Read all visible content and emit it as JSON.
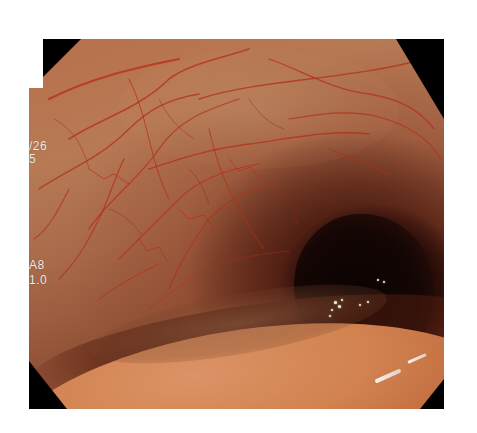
{
  "image": {
    "description": "Endoscopic (colonoscopy) view of colonic lumen with visible submucosal vascular pattern",
    "frame_shape": "octagonal endoscope frame with black corners"
  },
  "overlay": {
    "date_fragment": "/26",
    "line2": "5",
    "mode_label": "A8",
    "ratio_value": "1.0"
  },
  "colors": {
    "mucosa_light": "#dc9366",
    "mucosa_mid": "#b8704a",
    "vessel": "#b52d18",
    "lumen_dark": "#0d0403",
    "frame_black": "#000000",
    "overlay_text": "#f2ede6"
  }
}
